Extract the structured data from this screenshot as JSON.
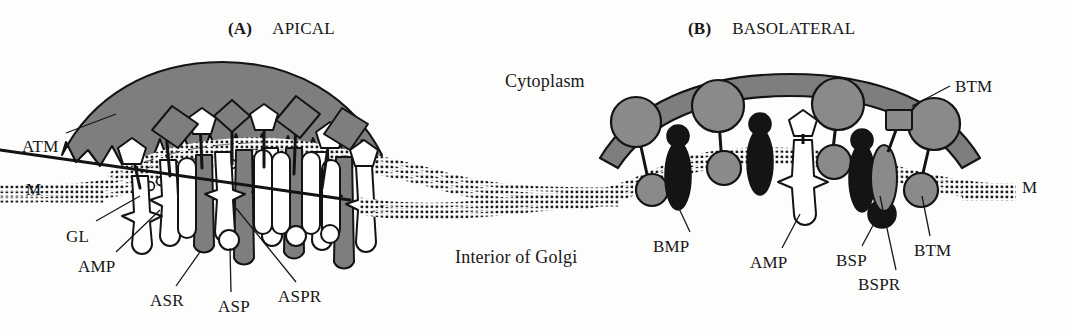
{
  "figure": {
    "background_color": "#fdfdfc",
    "ink_color": "#171717",
    "gray_fill": "#808080",
    "black_fill": "#111111",
    "white_fill": "#ffffff"
  },
  "panels": [
    {
      "id": "A",
      "tag": "(A)",
      "title": "APICAL",
      "title_x": 228,
      "title_y": 20
    },
    {
      "id": "B",
      "tag": "(B)",
      "title": "BASOLATERAL",
      "title_x": 688,
      "title_y": 20
    }
  ],
  "compartments": [
    {
      "name": "cytoplasm-label",
      "text": "Cytoplasm",
      "x": 505,
      "y": 72
    },
    {
      "name": "golgi-interior-label",
      "text": "Interior of Golgi",
      "x": 455,
      "y": 248
    }
  ],
  "annotations": [
    {
      "name": "atm-label",
      "text": "ATM",
      "x": 22,
      "y": 138,
      "panel": "A"
    },
    {
      "name": "m-left-label",
      "text": "M",
      "x": 26,
      "y": 188,
      "panel": "A"
    },
    {
      "name": "gl-label",
      "text": "GL",
      "x": 66,
      "y": 228,
      "panel": "A"
    },
    {
      "name": "amp-a-label",
      "text": "AMP",
      "x": 78,
      "y": 258,
      "panel": "A"
    },
    {
      "name": "asr-label",
      "text": "ASR",
      "x": 150,
      "y": 294,
      "panel": "A"
    },
    {
      "name": "asp-label",
      "text": "ASP",
      "x": 222,
      "y": 300,
      "panel": "A"
    },
    {
      "name": "aspr-label",
      "text": "ASPR",
      "x": 282,
      "y": 290,
      "panel": "A"
    },
    {
      "name": "btm-top-label",
      "text": "BTM",
      "x": 955,
      "y": 78,
      "panel": "B"
    },
    {
      "name": "m-right-label",
      "text": "M",
      "x": 1025,
      "y": 186,
      "panel": "B"
    },
    {
      "name": "bmp-label",
      "text": "BMP",
      "x": 655,
      "y": 240,
      "panel": "B"
    },
    {
      "name": "amp-b-label",
      "text": "AMP",
      "x": 752,
      "y": 256,
      "panel": "B"
    },
    {
      "name": "bsp-label",
      "text": "BSP",
      "x": 838,
      "y": 254,
      "panel": "B"
    },
    {
      "name": "bspr-label",
      "text": "BSPR",
      "x": 860,
      "y": 278,
      "panel": "B"
    },
    {
      "name": "btm-bottom-label",
      "text": "BTM",
      "x": 916,
      "y": 244,
      "panel": "B"
    }
  ],
  "legend_keys": [
    {
      "abbr": "ATM",
      "meaning": "apical transmembrane"
    },
    {
      "abbr": "M",
      "meaning": "membrane"
    },
    {
      "abbr": "GL",
      "meaning": "glycolipid"
    },
    {
      "abbr": "AMP",
      "meaning": "apical membrane protein"
    },
    {
      "abbr": "ASR",
      "meaning": "apical sorting receptor"
    },
    {
      "abbr": "ASP",
      "meaning": "apical sorting protein"
    },
    {
      "abbr": "ASPR",
      "meaning": "apical sorting protein receptor"
    },
    {
      "abbr": "BTM",
      "meaning": "basolateral transmembrane"
    },
    {
      "abbr": "BMP",
      "meaning": "basolateral membrane protein"
    },
    {
      "abbr": "BSP",
      "meaning": "basolateral sorting protein"
    },
    {
      "abbr": "BSPR",
      "meaning": "basolateral sorting protein receptor"
    }
  ],
  "icons": {
    "leader_line": "leader-line-icon",
    "membrane_bilayer": "dotted-membrane-icon",
    "coat_zigzag": "zigzag-coat-icon",
    "vesicle_dome": "vesicle-dome-icon"
  }
}
